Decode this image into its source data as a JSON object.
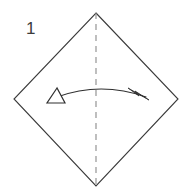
{
  "canvas": {
    "width": 189,
    "height": 194,
    "background_color": "#ffffff"
  },
  "diagram": {
    "step_label": "1",
    "line_color": "#3a3a3a",
    "crease_color": "#8a8a8a",
    "arrow_color": "#2f2f2f",
    "shape": {
      "name": "square-rotated-45",
      "vertices": [
        {
          "name": "top",
          "x": 96,
          "y": 13
        },
        {
          "name": "right",
          "x": 178,
          "y": 99
        },
        {
          "name": "bottom",
          "x": 96,
          "y": 186
        },
        {
          "name": "left",
          "x": 14,
          "y": 99
        }
      ]
    },
    "crease_line": {
      "name": "vertical-valley-crease",
      "x1": 96,
      "y1": 13,
      "x2": 96,
      "y2": 186,
      "dash_on": 6,
      "dash_off": 5
    },
    "arrow": {
      "name": "double-headed-fold-arrow",
      "path": "M 57 97 Q 101 81 146 97",
      "left_head": {
        "style": "hollow-triangle",
        "points": "57,88 47,103 65,103"
      },
      "right_head": {
        "style": "filled-barb",
        "points": "149,100 128,88 139,96 135,91"
      }
    }
  }
}
